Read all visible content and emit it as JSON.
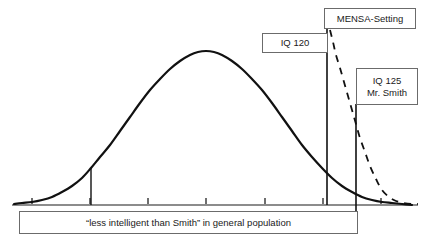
{
  "figure": {
    "background_color": "#ffffff",
    "stroke_color": "#111111",
    "box_border_color": "#6b6b6b",
    "axis_color": "#8c8c8c"
  },
  "callouts": {
    "mensa": {
      "label": "MENSA-Setting"
    },
    "iq120": {
      "label": "IQ 120"
    },
    "iq125": {
      "line1": "IQ 125",
      "line2": "Mr. Smith"
    }
  },
  "caption": {
    "text": "“less intelligent than Smith” in general population"
  },
  "chart_data": {
    "type": "line",
    "xlabel": "",
    "ylabel": "",
    "grid": false,
    "legend_position": "none",
    "axis": {
      "baseline_y_px": 205,
      "x_start_px": 12,
      "x_end_px": 418,
      "tick_positions_px": [
        32,
        90,
        148,
        206,
        265,
        323,
        381
      ],
      "tick_labels": [
        "",
        "",
        "",
        "",
        "",
        "",
        ""
      ]
    },
    "series": [
      {
        "name": "general population",
        "style": "solid",
        "description": "normal distribution bell curve",
        "peak_x_px": 206,
        "peak_y_px": 51,
        "points_px": [
          [
            14,
            204
          ],
          [
            22,
            203
          ],
          [
            32,
            202
          ],
          [
            42,
            200
          ],
          [
            52,
            197
          ],
          [
            62,
            192
          ],
          [
            72,
            186
          ],
          [
            82,
            178
          ],
          [
            91,
            168
          ],
          [
            100,
            157
          ],
          [
            110,
            145
          ],
          [
            120,
            131
          ],
          [
            130,
            117
          ],
          [
            140,
            103
          ],
          [
            150,
            90
          ],
          [
            160,
            79
          ],
          [
            170,
            69
          ],
          [
            180,
            61
          ],
          [
            190,
            55
          ],
          [
            198,
            52
          ],
          [
            206,
            51
          ],
          [
            214,
            52
          ],
          [
            222,
            55
          ],
          [
            232,
            61
          ],
          [
            242,
            69
          ],
          [
            252,
            79
          ],
          [
            262,
            90
          ],
          [
            272,
            103
          ],
          [
            282,
            117
          ],
          [
            292,
            131
          ],
          [
            302,
            145
          ],
          [
            312,
            157
          ],
          [
            322,
            168
          ],
          [
            332,
            178
          ],
          [
            342,
            186
          ],
          [
            352,
            192
          ],
          [
            362,
            197
          ],
          [
            372,
            200
          ],
          [
            382,
            202
          ],
          [
            392,
            203
          ],
          [
            402,
            204
          ],
          [
            412,
            205
          ]
        ]
      },
      {
        "name": "MENSA-Setting",
        "style": "dashed",
        "description": "truncated conditional distribution above the MENSA cutoff",
        "points_px": [
          [
            330,
            30
          ],
          [
            333,
            42
          ],
          [
            336,
            55
          ],
          [
            340,
            68
          ],
          [
            344,
            82
          ],
          [
            348,
            96
          ],
          [
            352,
            110
          ],
          [
            356,
            124
          ],
          [
            360,
            138
          ],
          [
            365,
            152
          ],
          [
            370,
            166
          ],
          [
            376,
            179
          ],
          [
            382,
            190
          ],
          [
            389,
            197
          ],
          [
            396,
            201
          ],
          [
            404,
            203
          ],
          [
            412,
            204
          ],
          [
            418,
            204
          ]
        ]
      }
    ],
    "markers": [
      {
        "name": "left-reference-line",
        "x_px": 91,
        "y_top_px": 168,
        "y_bottom_px": 205,
        "style": "solid"
      },
      {
        "name": "iq120-line",
        "x_px": 327,
        "y_top_px": 29,
        "y_bottom_px": 205,
        "style": "solid",
        "label": "IQ 120"
      },
      {
        "name": "iq125-line",
        "x_px": 356,
        "y_top_px": 104,
        "y_bottom_px": 212,
        "style": "solid",
        "label": "IQ 125 Mr. Smith"
      }
    ]
  }
}
